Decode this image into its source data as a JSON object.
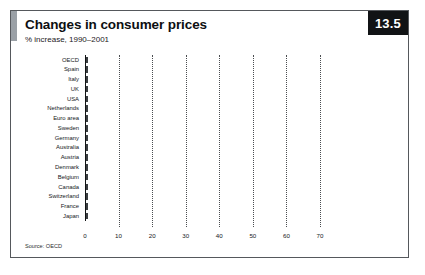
{
  "badge": {
    "number": "13.5"
  },
  "header": {
    "title": "Changes in consumer prices",
    "subtitle": "% increase, 1990–2001"
  },
  "footer": {
    "source": "Source: OECD"
  },
  "chart_data": {
    "type": "bar",
    "orientation": "horizontal",
    "title": "Changes in consumer prices",
    "subtitle": "% increase, 1990–2001",
    "xlabel": "",
    "ylabel": "",
    "xlim": [
      0,
      70
    ],
    "xticks": [
      0,
      10,
      20,
      30,
      40,
      50,
      60,
      70
    ],
    "xtick_labels": [
      "0",
      "10",
      "20",
      "30",
      "40",
      "50",
      "60",
      "70"
    ],
    "grid": "vertical-dotted",
    "legend": "none",
    "source": "Source: OECD",
    "categories": [
      "OECD",
      "Spain",
      "Italy",
      "UK",
      "USA",
      "Netherlands",
      "Euro area",
      "Sweden",
      "Germany",
      "Australia",
      "Austria",
      "Denmark",
      "Belgium",
      "Canada",
      "Switzerland",
      "France",
      "Japan"
    ],
    "values": [
      64,
      61,
      40,
      38,
      35,
      33,
      32.5,
      32,
      31,
      30.5,
      29,
      27.5,
      26.5,
      25,
      23,
      22,
      8
    ]
  },
  "colors": {
    "bar_fill": "#c9c9c9",
    "bar_stroke": "#3a3d40",
    "badge_bg": "#111315",
    "badge_text": "#ffffff",
    "frame": "#55585c",
    "accent": "#9aa0a6"
  }
}
